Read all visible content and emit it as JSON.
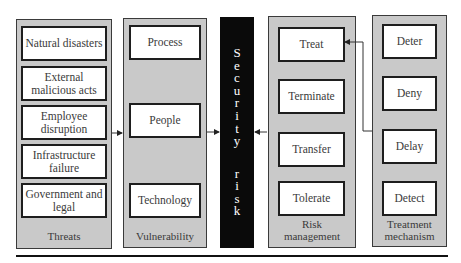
{
  "diagram": {
    "threats": {
      "label": "Threats",
      "items": [
        "Natural disasters",
        "External malicious acts",
        "Employee disruption",
        "Infrastructure failure",
        "Government and legal"
      ]
    },
    "vulnerability": {
      "label": "Vulnerability",
      "items": [
        "Process",
        "People",
        "Technology"
      ]
    },
    "security_risk": {
      "label": "Security risk",
      "letters": [
        "S",
        "e",
        "c",
        "u",
        "r",
        "i",
        "t",
        "y",
        " ",
        "r",
        "i",
        "s",
        "k"
      ]
    },
    "risk_management": {
      "label_line1": "Risk",
      "label_line2": "management",
      "items": [
        "Treat",
        "Terminate",
        "Transfer",
        "Tolerate"
      ]
    },
    "treatment_mechanism": {
      "label_line1": "Treatment",
      "label_line2": "mechanism",
      "items": [
        "Deter",
        "Deny",
        "Delay",
        "Detect"
      ]
    },
    "connections": [
      {
        "from": "Threats",
        "to": "Vulnerability"
      },
      {
        "from": "Vulnerability",
        "to": "Security risk"
      },
      {
        "from": "Risk management",
        "to": "Security risk"
      },
      {
        "from": "Treatment mechanism",
        "to": "Treat"
      }
    ],
    "colors": {
      "panel_fill": "#c9c9c9",
      "box_fill": "#ffffff",
      "risk_bar": "#0a0a0a"
    }
  }
}
